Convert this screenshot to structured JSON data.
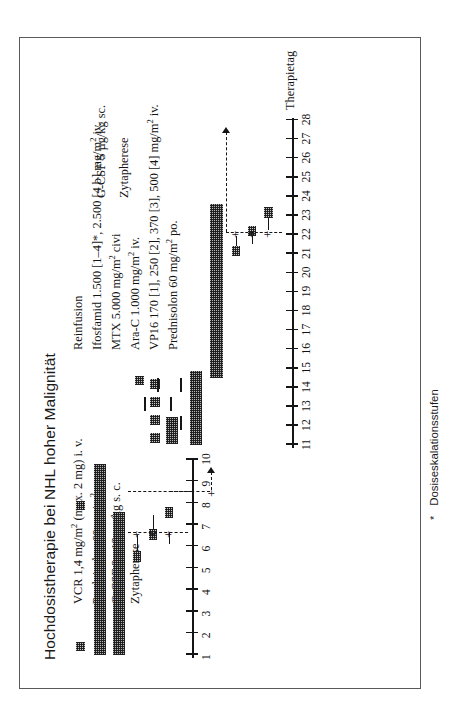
{
  "figure": {
    "title": "Hochdosistherapie bei NHL hoher Malignität",
    "footnote_marker": "*",
    "footnote_text": "Dosiseskalationsstufen",
    "axis_name": "Therapietag"
  },
  "block1": {
    "labels": [
      "VCR 1,4 mg/m² (max. 2 mg) i. v.",
      "Prednisolon 60 mg/m² p. o.",
      "G-CSF 2× 12 µg/kg s. c.",
      "Zytapherese"
    ]
  },
  "block2": {
    "labels": [
      "Reinfusion",
      "Ifosfamid 1.500 [1–4]*, 2.500 [4 b] mg/m² iv.",
      "MTX 5.000 mg/m² civi",
      "Ara-C 1.000 mg/m² iv.",
      "VP16 170 [1], 250 [2], 370 [3], 500 [4] mg/m² iv.",
      "Prednisolon 60 mg/m² po."
    ]
  },
  "block3": {
    "labels": [
      "G-CSF 5 µg/kg sc.",
      "Zytapherese"
    ]
  },
  "axis1": {
    "ticks": [
      "1",
      "2",
      "3",
      "4",
      "5",
      "6",
      "7",
      "8",
      "9",
      "10"
    ]
  },
  "axis2": {
    "ticks": [
      "11",
      "12",
      "13",
      "14",
      "15",
      "16",
      "17",
      "18",
      "19",
      "20",
      "21",
      "22",
      "23",
      "24",
      "25",
      "26",
      "27",
      "28"
    ]
  },
  "chart_data": {
    "type": "bar",
    "title": "Hochdosistherapie bei NHL hoher Malignität",
    "xlabel": "Therapietag",
    "ylabel": "",
    "grid": false,
    "legend": "none",
    "axes": [
      {
        "name": "axis-1",
        "range": [
          1,
          10
        ],
        "ticks": [
          1,
          2,
          3,
          4,
          5,
          6,
          7,
          8,
          9,
          10
        ]
      },
      {
        "name": "axis-2",
        "range": [
          11,
          28
        ],
        "ticks": [
          11,
          12,
          13,
          14,
          15,
          16,
          17,
          18,
          19,
          20,
          21,
          22,
          23,
          24,
          25,
          26,
          27,
          28
        ]
      }
    ],
    "series": [
      {
        "name": "VCR 1,4 mg/m² (max. 2 mg) i. v.",
        "axis": "axis-1",
        "days": [
          1,
          8
        ]
      },
      {
        "name": "Prednisolon 60 mg/m² p. o.",
        "axis": "axis-1",
        "days": [
          1,
          2,
          3,
          4,
          5,
          6,
          7,
          8,
          9,
          10
        ]
      },
      {
        "name": "G-CSF 2× 12 µg/kg s. c.",
        "axis": "axis-1",
        "days": [
          1,
          2,
          3,
          4,
          5,
          6,
          7
        ]
      },
      {
        "name": "Zytapherese",
        "axis": "axis-1",
        "days": [
          5,
          6,
          7
        ]
      },
      {
        "name": "Reinfusion",
        "axis": "axis-2",
        "days": [
          15
        ]
      },
      {
        "name": "Ifosfamid 1.500 [1–4]*, 2.500 [4 b] mg/m² iv.",
        "axis": "axis-2",
        "days": [
          11,
          12,
          13,
          14
        ]
      },
      {
        "name": "MTX 5.000 mg/m² civi",
        "axis": "axis-2",
        "days": [
          11,
          12
        ]
      },
      {
        "name": "Ara-C 1.000 mg/m² iv.",
        "axis": "axis-2",
        "days": [
          13,
          14
        ]
      },
      {
        "name": "VP16 170 [1], 250 [2], 370 [3], 500 [4] mg/m² iv.",
        "axis": "axis-2",
        "days": [
          12,
          13,
          14
        ]
      },
      {
        "name": "Prednisolon 60 mg/m² po.",
        "axis": "axis-2",
        "days": [
          11,
          12,
          13,
          14,
          15
        ]
      },
      {
        "name": "G-CSF 5 µg/kg sc.",
        "axis": "axis-2",
        "days": [
          15,
          16,
          17,
          18,
          19,
          20,
          21,
          22,
          23,
          24,
          25,
          26,
          27
        ]
      },
      {
        "name": "Zytapherese",
        "axis": "axis-2",
        "days": [
          25,
          26,
          27
        ]
      }
    ],
    "annotations": [
      {
        "text": "*",
        "meaning": "Dosiseskalationsstufen"
      }
    ]
  }
}
